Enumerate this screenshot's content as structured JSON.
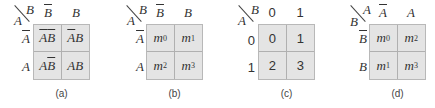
{
  "figure": {
    "maps": [
      {
        "id": "a",
        "caption": "(a)",
        "corner": {
          "top_var": "B",
          "left_var": "A"
        },
        "col_headers": [
          {
            "text": "B",
            "bar": true
          },
          {
            "text": "B",
            "bar": false
          }
        ],
        "row_headers": [
          {
            "text": "A",
            "bar": true
          },
          {
            "text": "A",
            "bar": false
          }
        ],
        "cells": [
          [
            {
              "parts": [
                {
                  "t": "A",
                  "bar": true
                },
                {
                  "t": "B",
                  "bar": true
                }
              ]
            },
            {
              "parts": [
                {
                  "t": "A",
                  "bar": true
                },
                {
                  "t": "B",
                  "bar": false
                }
              ]
            }
          ],
          [
            {
              "parts": [
                {
                  "t": "A",
                  "bar": false
                },
                {
                  "t": "B",
                  "bar": true
                }
              ]
            },
            {
              "parts": [
                {
                  "t": "A",
                  "bar": false
                },
                {
                  "t": "B",
                  "bar": false
                }
              ]
            }
          ]
        ]
      },
      {
        "id": "b",
        "caption": "(b)",
        "corner": {
          "top_var": "B",
          "left_var": "A"
        },
        "col_headers": [
          {
            "text": "B",
            "bar": true
          },
          {
            "text": "B",
            "bar": false
          }
        ],
        "row_headers": [
          {
            "text": "A",
            "bar": true
          },
          {
            "text": "A",
            "bar": false
          }
        ],
        "cells": [
          [
            {
              "m": "m",
              "sub": "0"
            },
            {
              "m": "m",
              "sub": "1"
            }
          ],
          [
            {
              "m": "m",
              "sub": "2"
            },
            {
              "m": "m",
              "sub": "3"
            }
          ]
        ]
      },
      {
        "id": "c",
        "caption": "(c)",
        "corner": {
          "top_var": "B",
          "left_var": "A"
        },
        "col_headers": [
          {
            "text": "0",
            "bar": false
          },
          {
            "text": "1",
            "bar": false
          }
        ],
        "row_headers": [
          {
            "text": "0",
            "bar": false
          },
          {
            "text": "1",
            "bar": false
          }
        ],
        "cells": [
          [
            {
              "n": "0"
            },
            {
              "n": "1"
            }
          ],
          [
            {
              "n": "2"
            },
            {
              "n": "3"
            }
          ]
        ]
      },
      {
        "id": "d",
        "caption": "(d)",
        "corner": {
          "top_var": "A",
          "left_var": "B"
        },
        "col_headers": [
          {
            "text": "A",
            "bar": true
          },
          {
            "text": "A",
            "bar": false
          }
        ],
        "row_headers": [
          {
            "text": "B",
            "bar": true
          },
          {
            "text": "B",
            "bar": false
          }
        ],
        "cells": [
          [
            {
              "m": "m",
              "sub": "0"
            },
            {
              "m": "m",
              "sub": "2"
            }
          ],
          [
            {
              "m": "m",
              "sub": "1"
            },
            {
              "m": "m",
              "sub": "3"
            }
          ]
        ]
      }
    ],
    "colors": {
      "cell_fill": "#e4e4e4",
      "grid_line": "#b0b0b0",
      "text": "#333333"
    }
  }
}
